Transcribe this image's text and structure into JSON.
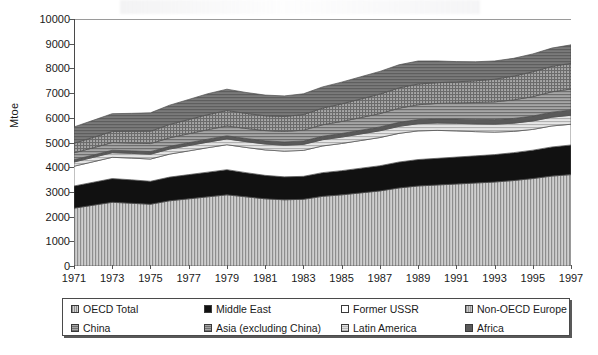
{
  "chart_data": {
    "type": "area",
    "stacked": true,
    "title": "",
    "xlabel": "",
    "ylabel": "Mtoe",
    "ylim": [
      0,
      10000
    ],
    "ytick_step": 1000,
    "yticks": [
      "0",
      "1000",
      "2000",
      "3000",
      "4000",
      "5000",
      "6000",
      "7000",
      "8000",
      "9000",
      "10000"
    ],
    "xlim": [
      1971,
      1997
    ],
    "xtick_step": 2,
    "xticks": [
      "1971",
      "1973",
      "1975",
      "1977",
      "1979",
      "1981",
      "1983",
      "1985",
      "1987",
      "1989",
      "1991",
      "1993",
      "1995",
      "1997"
    ],
    "grid": false,
    "legend_position": "bottom",
    "legend_columns": 4,
    "x": [
      1971,
      1972,
      1973,
      1974,
      1975,
      1976,
      1977,
      1978,
      1979,
      1980,
      1981,
      1982,
      1983,
      1984,
      1985,
      1986,
      1987,
      1988,
      1989,
      1990,
      1991,
      1992,
      1993,
      1994,
      1995,
      1996,
      1997
    ],
    "stack_order_bottom_to_top": [
      "OECD Total",
      "Middle East",
      "Former USSR",
      "Latin America",
      "Africa",
      "Asia (excluding China)",
      "China",
      "Non-OECD Europe"
    ],
    "series": [
      {
        "name": "OECD Total",
        "pattern": "vertical-stripes",
        "color": "#b0b0b0",
        "values": [
          2340,
          2460,
          2580,
          2540,
          2500,
          2640,
          2720,
          2800,
          2880,
          2800,
          2720,
          2680,
          2700,
          2820,
          2880,
          2960,
          3040,
          3160,
          3240,
          3280,
          3320,
          3360,
          3400,
          3460,
          3540,
          3640,
          3700
        ]
      },
      {
        "name": "Middle East",
        "pattern": "solid-black",
        "color": "#111111",
        "values": [
          900,
          930,
          960,
          950,
          930,
          960,
          980,
          1000,
          1020,
          980,
          950,
          930,
          930,
          960,
          980,
          1000,
          1020,
          1050,
          1070,
          1080,
          1090,
          1100,
          1110,
          1130,
          1150,
          1180,
          1200
        ]
      },
      {
        "name": "Former USSR",
        "pattern": "white",
        "color": "#ffffff",
        "values": [
          800,
          830,
          860,
          880,
          900,
          930,
          960,
          990,
          1010,
          1020,
          1030,
          1040,
          1050,
          1080,
          1100,
          1120,
          1140,
          1160,
          1160,
          1130,
          1060,
          980,
          910,
          860,
          840,
          850,
          840
        ]
      },
      {
        "name": "Latin America",
        "pattern": "light-horizontal-stripes",
        "color": "#d0d0d0",
        "values": [
          170,
          178,
          186,
          190,
          195,
          205,
          215,
          225,
          235,
          235,
          238,
          240,
          243,
          252,
          258,
          266,
          274,
          284,
          292,
          298,
          306,
          314,
          322,
          332,
          342,
          354,
          364
        ]
      },
      {
        "name": "Africa",
        "pattern": "solid-dark-gray",
        "color": "#5a5a5a",
        "values": [
          90,
          94,
          99,
          102,
          105,
          110,
          116,
          121,
          126,
          128,
          131,
          133,
          136,
          141,
          146,
          151,
          156,
          162,
          167,
          171,
          176,
          181,
          186,
          192,
          198,
          205,
          211
        ]
      },
      {
        "name": "Asia (excluding China)",
        "pattern": "horizontal-stripes",
        "color": "#8c8c8c",
        "values": [
          280,
          296,
          312,
          318,
          326,
          345,
          364,
          384,
          400,
          405,
          415,
          425,
          440,
          465,
          488,
          512,
          540,
          572,
          600,
          624,
          652,
          684,
          716,
          752,
          788,
          824,
          850
        ]
      },
      {
        "name": "China",
        "pattern": "crosshatch",
        "color": "#8a8a8a",
        "values": [
          390,
          420,
          450,
          470,
          500,
          540,
          575,
          610,
          625,
          610,
          598,
          606,
          632,
          672,
          712,
          752,
          790,
          824,
          840,
          838,
          852,
          880,
          918,
          962,
          1005,
          1030,
          1040
        ]
      },
      {
        "name": "Non-OECD Europe",
        "pattern": "dark-gray-stripes",
        "color": "#6e6e6e",
        "values": [
          660,
          690,
          720,
          730,
          745,
          780,
          812,
          845,
          862,
          848,
          838,
          832,
          840,
          860,
          880,
          900,
          918,
          934,
          930,
          880,
          820,
          770,
          738,
          720,
          722,
          740,
          748
        ]
      }
    ]
  },
  "legend": {
    "items": [
      {
        "label": "OECD Total",
        "swatch": "sw-oecd"
      },
      {
        "label": "Middle East",
        "swatch": "sw-me"
      },
      {
        "label": "Former USSR",
        "swatch": "sw-ussr"
      },
      {
        "label": "Non-OECD Europe",
        "swatch": "sw-noneur"
      },
      {
        "label": "China",
        "swatch": "sw-china"
      },
      {
        "label": "Asia (excluding China)",
        "swatch": "sw-asia"
      },
      {
        "label": "Latin America",
        "swatch": "sw-latam"
      },
      {
        "label": "Africa",
        "swatch": "sw-africa"
      }
    ]
  }
}
